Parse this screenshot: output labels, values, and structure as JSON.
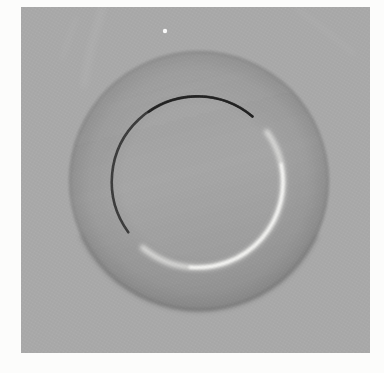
{
  "scene": {
    "description": "Grayscale halftone photograph of a round dinner plate viewed from above on a plain gray surface, lit from the lower right. The inner well of the plate is outlined by a thin dark shadow arc on the upper left and a soft bright highlight arc on the lower right. A soft shadow marks the plate's lower outer edge, a tiny white speck sits near the top of the background, and the scanned print has uneven white margins.",
    "page_background": "#fcfcfb",
    "photo": {
      "x": 21,
      "y": 7,
      "width": 349,
      "height": 346,
      "surface_color": "#a9a9a9"
    },
    "plate": {
      "cx": 199,
      "cy": 181,
      "outer_radius": 130,
      "well_color": "#a6a6a6",
      "mid_color": "#a2a2a2",
      "rim_color": "#9e9e9e",
      "rim_outer_color": "#949494",
      "edge_color": "#8a8a8a",
      "edge_shadow_path": "M 316.8 235.9 A 130 130 0 0 1 81.2 235.9",
      "edge_shadow_color": "#6f6f6f"
    },
    "inner_well": {
      "cx": 197.5,
      "cy": 182,
      "radius": 85.5,
      "dark_arc": {
        "path": "M 252.5 116.5 A 85.5 85.5 0 0 0 128.3 232.3",
        "color": "#3a3a3a",
        "tip_path": "M 252.5 116.5 A 85.5 85.5 0 0 0 148.5 112.0",
        "tip_color": "#1f1f1f"
      },
      "highlight_arc": {
        "path": "M 266.7 131.8 A 85.5 85.5 0 0 1 142.5 247.5",
        "color": "#e6e6e4",
        "core_path": "M 281.1 164.2 A 85.5 85.5 0 0 1 190.0 267.2",
        "core_color": "#fafaf8"
      }
    },
    "artifacts": {
      "speck": {
        "cx": 165,
        "cy": 31,
        "r": 2.2,
        "color": "#ffffff"
      },
      "streak_color": "#ffffff",
      "streaks": [
        {
          "path": "M 103 7 C 96 30, 88 55, 84 86"
        },
        {
          "path": "M 76 18 C 71 32, 66 46, 62 60"
        },
        {
          "path": "M 296 8 C 314 22, 334 36, 354 54"
        }
      ]
    },
    "halftone": {
      "dot_color": "#3c3c3c",
      "light_dot_color": "#ffffff"
    }
  }
}
